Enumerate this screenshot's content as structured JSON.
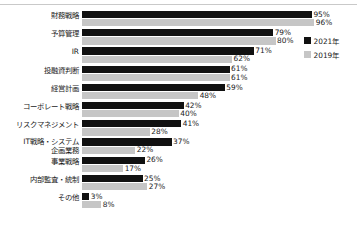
{
  "chart_data": {
    "type": "bar",
    "orientation": "horizontal",
    "title": "",
    "subtitle": "",
    "xlabel": "",
    "ylabel": "",
    "xlim": [
      0,
      100
    ],
    "grid": false,
    "legend_position": "right-top",
    "value_suffix": "%",
    "categories": [
      "財務戦略",
      "予算管理",
      "IR",
      "投融資判断",
      "経営計画",
      "コーポレート戦略",
      "リスクマネジメント",
      "IT戦略・システム\n企画業務",
      "事業戦略",
      "内部監査・統制",
      "その他"
    ],
    "series": [
      {
        "name": "2021年",
        "color": "#111111",
        "values": [
          95,
          79,
          71,
          61,
          59,
          42,
          41,
          37,
          26,
          25,
          3
        ],
        "labels": [
          "95%",
          "79%",
          "71%",
          "61%",
          "59%",
          "42%",
          "41%",
          "37%",
          "26%",
          "25%",
          "3%"
        ]
      },
      {
        "name": "2019年",
        "color": "#c6c6c6",
        "values": [
          96,
          80,
          62,
          61,
          48,
          40,
          28,
          22,
          17,
          27,
          8
        ],
        "labels": [
          "96%",
          "80%",
          "62%",
          "61%",
          "48%",
          "40%",
          "28%",
          "22%",
          "17%",
          "27%",
          "8%"
        ]
      }
    ]
  },
  "legend": {
    "items": [
      {
        "label": "2021年",
        "color": "#111111"
      },
      {
        "label": "2019年",
        "color": "#c6c6c6"
      }
    ]
  },
  "colors": {
    "series_2021": "#111111",
    "series_2019": "#c6c6c6",
    "background": "#ffffff",
    "text": "#1a1a1a",
    "top_rule": "#c9c9c9"
  }
}
